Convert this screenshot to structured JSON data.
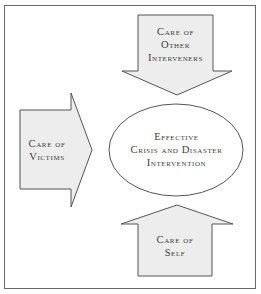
{
  "diagram": {
    "type": "converging-arrows",
    "center": {
      "lines": [
        "Effective",
        "Crisis and Disaster",
        "Intervention"
      ]
    },
    "arrows": [
      {
        "id": "top",
        "direction": "down",
        "lines": [
          "Care of",
          "Other",
          "Interveners"
        ]
      },
      {
        "id": "left",
        "direction": "right",
        "lines": [
          "Care of",
          "Victims"
        ]
      },
      {
        "id": "bottom",
        "direction": "up",
        "lines": [
          "Care of",
          "Self"
        ]
      }
    ],
    "colors": {
      "arrow_fill": "#ededed",
      "stroke": "#555555",
      "ellipse_fill": "#ffffff",
      "frame": "#6a6a6a",
      "text": "#3c3c3c"
    }
  }
}
